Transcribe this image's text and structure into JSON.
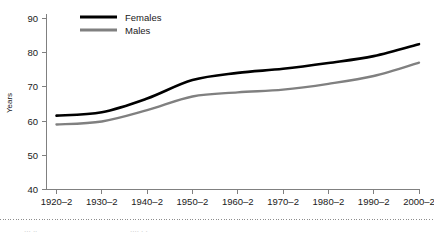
{
  "chart_data": {
    "type": "line",
    "title": "",
    "subtitle": "",
    "xlabel": "",
    "ylabel": "Years",
    "xlim": [
      0,
      8
    ],
    "ylim": [
      40,
      90
    ],
    "ytick_step": 10,
    "yticks": [
      "40",
      "50",
      "60",
      "70",
      "80",
      "90"
    ],
    "grid": false,
    "legend_position": "top-left-inside",
    "categories": [
      "1920–2",
      "1930–2",
      "1940–2",
      "1950–2",
      "1960–2",
      "1970–2",
      "1980–2",
      "1990–2",
      "2000–2"
    ],
    "series": [
      {
        "name": "Females",
        "color": "#000000",
        "width": 2.6,
        "values": [
          61.6,
          62.6,
          66.6,
          72.0,
          74.1,
          75.3,
          77.0,
          79.0,
          82.5
        ]
      },
      {
        "name": "Males",
        "color": "#808080",
        "width": 2.4,
        "values": [
          59.0,
          59.9,
          63.2,
          67.2,
          68.4,
          69.2,
          70.9,
          73.2,
          77.1
        ]
      }
    ]
  },
  "axes": {
    "y_axis_title": "Years",
    "y_tick_labels": [
      "90",
      "80",
      "70",
      "60",
      "50",
      "40"
    ],
    "x_tick_labels": [
      "1920–2",
      "1930–2",
      "1940–2",
      "1950–2",
      "1960–2",
      "1970–2",
      "1980–2",
      "1990–2",
      "2000–2"
    ]
  },
  "legend": {
    "items": [
      {
        "label": "Females",
        "color": "#000000"
      },
      {
        "label": "Males",
        "color": "#808080"
      }
    ]
  },
  "footer": {
    "separator": "dotted-rule"
  }
}
